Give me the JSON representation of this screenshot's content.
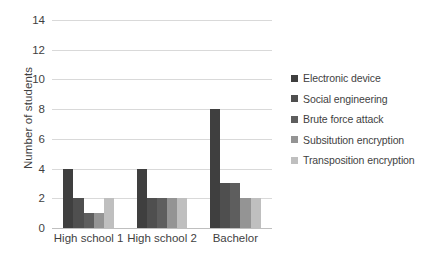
{
  "chart_data": {
    "type": "bar",
    "title": "",
    "xlabel": "",
    "ylabel": "Number of students",
    "categories": [
      "High school 1",
      "High school 2",
      "Bachelor"
    ],
    "ylim": [
      0,
      14
    ],
    "ytick_step": 2,
    "yticks": [
      0,
      2,
      4,
      6,
      8,
      10,
      12,
      14
    ],
    "ytick_labels": [
      "0",
      "2",
      "4",
      "6",
      "8",
      "10",
      "12",
      "14"
    ],
    "grid": "horizontal",
    "legend_position": "right",
    "series": [
      {
        "name": "Electronic device",
        "color": "#3f3f3f",
        "values": [
          4,
          4,
          8
        ]
      },
      {
        "name": "Social engineering",
        "color": "#4f4f4f",
        "values": [
          2,
          2,
          3
        ]
      },
      {
        "name": "Brute force attack",
        "color": "#5e5e5e",
        "values": [
          1,
          2,
          3
        ]
      },
      {
        "name": "Subsitution encryption",
        "color": "#949494",
        "values": [
          1,
          2,
          2
        ]
      },
      {
        "name": "Transposition encryption",
        "color": "#bfbfbf",
        "values": [
          2,
          2,
          2
        ]
      }
    ]
  }
}
